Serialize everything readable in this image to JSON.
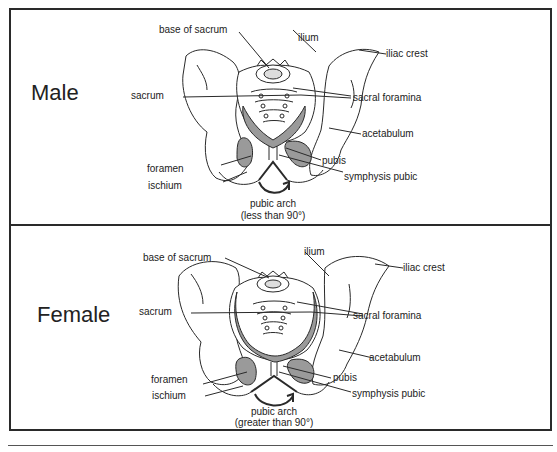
{
  "panels": [
    {
      "sex": "Male",
      "labels": {
        "base_of_sacrum": "base of sacrum",
        "ilium": "ilium",
        "iliac_crest": "iliac crest",
        "sacrum": "sacrum",
        "sacral_foramina": "sacral foramina",
        "acetabulum": "acetabulum",
        "foramen": "foramen",
        "pubis": "pubis",
        "symphysis_pubic": "symphysis pubic",
        "ischium": "ischium",
        "pubic_arch": "pubic arch",
        "pubic_arch_angle": "(less than 90°)"
      }
    },
    {
      "sex": "Female",
      "labels": {
        "base_of_sacrum": "base of sacrum",
        "ilium": "ilium",
        "iliac_crest": "iliac crest",
        "sacrum": "sacrum",
        "sacral_foramina": "sacral foramina",
        "acetabulum": "acetabulum",
        "foramen": "foramen",
        "pubis": "pubis",
        "symphysis_pubic": "symphysis pubic",
        "ischium": "ischium",
        "pubic_arch": "pubic arch",
        "pubic_arch_angle": "(greater than 90°)"
      }
    }
  ],
  "colors": {
    "outline": "#2a2a2a",
    "shade": "#9a9a9a",
    "background": "#ffffff"
  }
}
